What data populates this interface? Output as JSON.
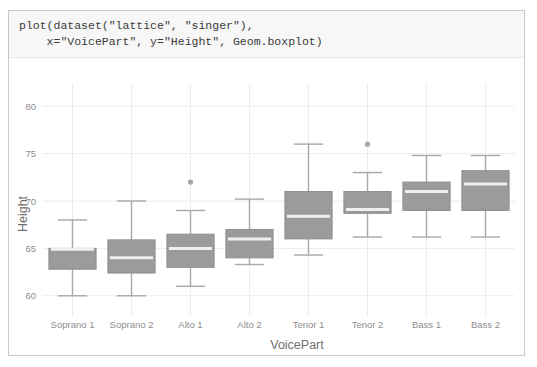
{
  "notebook": {
    "ghost_top_row": "",
    "code_line_1": "plot(dataset(\"lattice\", \"singer\"),",
    "code_line_2": "    x=\"VoicePart\", y=\"Height\", Geom.boxplot)"
  },
  "chart_data": {
    "type": "boxplot",
    "title": "",
    "xlabel": "VoicePart",
    "ylabel": "Height",
    "categories": [
      "Soprano 1",
      "Soprano 2",
      "Alto 1",
      "Alto 2",
      "Tenor 1",
      "Tenor 2",
      "Bass 1",
      "Bass 2"
    ],
    "ylim": [
      58.5,
      81.5
    ],
    "yticks": [
      60,
      65,
      70,
      75,
      80
    ],
    "ytick_labels": [
      "60",
      "65",
      "70",
      "75",
      "80"
    ],
    "grid": true,
    "grid_color": "#ececec",
    "box_fill": "#9b9b9b",
    "box_stroke": "#8f8f8f",
    "median_color": "#efefef",
    "whisker_color": "#a8a8a8",
    "outlier_color": "#a8a8a8",
    "boxes": [
      {
        "category": "Soprano 1",
        "whisker_low": 60.0,
        "q1": 62.8,
        "median": 64.9,
        "q3": 65.0,
        "whisker_high": 68.0,
        "outliers": []
      },
      {
        "category": "Soprano 2",
        "whisker_low": 60.0,
        "q1": 62.4,
        "median": 64.0,
        "q3": 65.9,
        "whisker_high": 70.0,
        "outliers": []
      },
      {
        "category": "Alto 1",
        "whisker_low": 61.0,
        "q1": 63.0,
        "median": 65.0,
        "q3": 66.5,
        "whisker_high": 69.0,
        "outliers": [
          72.0
        ]
      },
      {
        "category": "Alto 2",
        "whisker_low": 63.3,
        "q1": 64.0,
        "median": 66.0,
        "q3": 67.0,
        "whisker_high": 70.2,
        "outliers": []
      },
      {
        "category": "Tenor 1",
        "whisker_low": 64.3,
        "q1": 66.0,
        "median": 68.4,
        "q3": 71.0,
        "whisker_high": 76.0,
        "outliers": []
      },
      {
        "category": "Tenor 2",
        "whisker_low": 66.2,
        "q1": 68.7,
        "median": 69.1,
        "q3": 71.0,
        "whisker_high": 73.0,
        "outliers": [
          76.0
        ]
      },
      {
        "category": "Bass 1",
        "whisker_low": 66.2,
        "q1": 69.0,
        "median": 71.0,
        "q3": 72.0,
        "whisker_high": 74.8,
        "outliers": []
      },
      {
        "category": "Bass 2",
        "whisker_low": 66.2,
        "q1": 69.0,
        "median": 71.8,
        "q3": 73.2,
        "whisker_high": 74.8,
        "outliers": []
      }
    ]
  }
}
